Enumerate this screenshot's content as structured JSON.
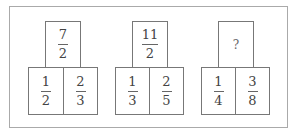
{
  "groups": [
    {
      "top": {
        "numerator": "7",
        "denominator": "2"
      },
      "bottom_left": {
        "numerator": "1",
        "denominator": "2"
      },
      "bottom_right": {
        "numerator": "2",
        "denominator": "3"
      }
    },
    {
      "top": {
        "numerator": "11",
        "denominator": "2"
      },
      "bottom_left": {
        "numerator": "1",
        "denominator": "3"
      },
      "bottom_right": {
        "numerator": "2",
        "denominator": "5"
      }
    },
    {
      "top": {
        "unknown": "?"
      },
      "bottom_left": {
        "numerator": "1",
        "denominator": "4"
      },
      "bottom_right": {
        "numerator": "3",
        "denominator": "8"
      }
    }
  ]
}
